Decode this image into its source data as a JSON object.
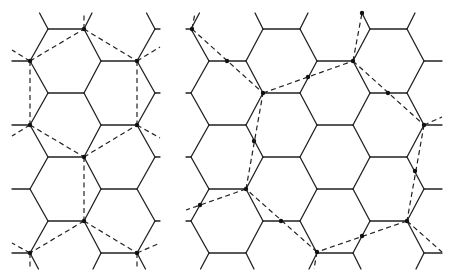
{
  "figure": {
    "colors": {
      "lattice": "#222222",
      "overlay": "#222222",
      "marker": "#111111",
      "background": "#ffffff"
    },
    "panels": [
      {
        "name": "left-panel",
        "overlay_style": "dashed",
        "markers": "lattice-vertices",
        "marker_count": 9
      },
      {
        "name": "right-panel",
        "overlay_style": "dashed",
        "markers": "lattice-vertices-and-edge-midpoints",
        "marker_count": 17
      }
    ]
  }
}
